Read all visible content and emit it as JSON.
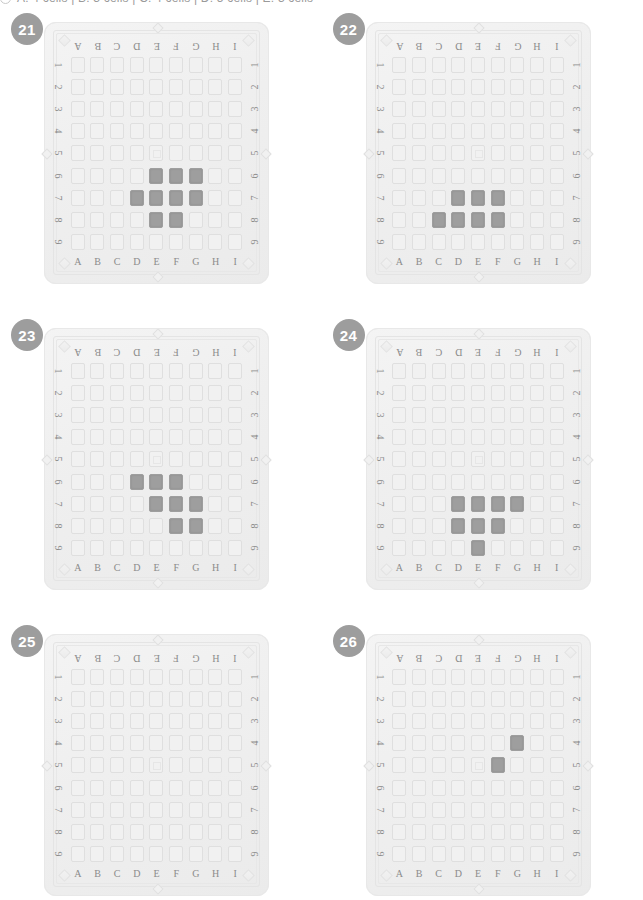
{
  "header": {
    "radio_icon": "radio-unselected-icon",
    "text": "A: 4 cells | B: 3 cells | C: 4 cells | D: 5 cells | E: 3 cells"
  },
  "board_spec": {
    "columns": [
      "A",
      "B",
      "C",
      "D",
      "E",
      "F",
      "G",
      "H",
      "I"
    ],
    "rows": [
      "1",
      "2",
      "3",
      "4",
      "5",
      "6",
      "7",
      "8",
      "9"
    ],
    "center_marker_cell": "E5",
    "empty_cell_color": "#f1f1f1",
    "filled_cell_color": "#9e9e9e",
    "badge_color": "#9d9d9d",
    "tray_color": "#efefef",
    "label_color": "#8b8b8b"
  },
  "puzzles": [
    {
      "number": "21",
      "filled": [
        "E6",
        "F6",
        "G6",
        "D7",
        "E7",
        "F7",
        "G7",
        "E8",
        "F8"
      ],
      "filled_count": 9
    },
    {
      "number": "22",
      "filled": [
        "D7",
        "E7",
        "F7",
        "C8",
        "D8",
        "E8",
        "F8"
      ],
      "filled_count": 7
    },
    {
      "number": "23",
      "filled": [
        "D6",
        "E6",
        "F6",
        "E7",
        "F7",
        "G7",
        "F8",
        "G8"
      ],
      "filled_count": 8
    },
    {
      "number": "24",
      "filled": [
        "D7",
        "E7",
        "F7",
        "G7",
        "D8",
        "E8",
        "F8",
        "E9"
      ],
      "filled_count": 8
    },
    {
      "number": "25",
      "filled": [],
      "filled_count": 0
    },
    {
      "number": "26",
      "filled": [
        "G4",
        "F5"
      ],
      "filled_count": 2
    }
  ]
}
